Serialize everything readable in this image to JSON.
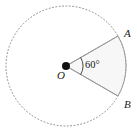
{
  "figure": {
    "type": "geometry-diagram",
    "width": 137,
    "height": 132,
    "background_color": "#ffffff"
  },
  "circle": {
    "name": "dotted-circle",
    "center": {
      "x": 66,
      "y": 66
    },
    "radius": 60,
    "stroke_color": "#8a8a8a",
    "stroke_style": "dotted",
    "stroke_width": 1
  },
  "center_point": {
    "label": "O",
    "x": 66,
    "y": 66,
    "dot_radius": 4,
    "color": "#111111"
  },
  "points": [
    {
      "label": "A",
      "x": 118,
      "y": 36,
      "angle_deg": -30,
      "position": "upper-right"
    },
    {
      "label": "B",
      "x": 118,
      "y": 96,
      "angle_deg": 30,
      "position": "lower-right"
    }
  ],
  "sector": {
    "name": "sector-OAB",
    "vertices": [
      "O",
      "A",
      "B"
    ],
    "fill_color": "#f7f7f7",
    "stroke_color": "#9a9a9a",
    "stroke_width": 1
  },
  "angle": {
    "label": "60°",
    "value": 60,
    "unit": "degrees",
    "at_vertex": "O",
    "arc_radius": 17,
    "arc_color": "#4a4a4a"
  },
  "radii": [
    {
      "name": "radius-OA",
      "from": "O",
      "to": "A"
    },
    {
      "name": "radius-OB",
      "from": "O",
      "to": "B"
    }
  ]
}
